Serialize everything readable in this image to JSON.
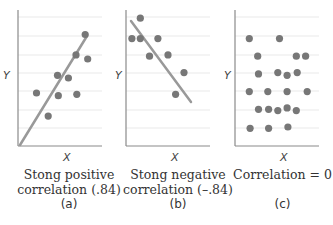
{
  "chart_data": [
    {
      "type": "scatter",
      "panel": "(a)",
      "title": "Stong positive correlation (.84)",
      "xlabel": "X",
      "ylabel": "Y",
      "grid": true,
      "trendline": true,
      "points": [
        {
          "x": 0.8,
          "y": 0.82
        },
        {
          "x": 0.69,
          "y": 0.67
        },
        {
          "x": 0.83,
          "y": 0.64
        },
        {
          "x": 0.47,
          "y": 0.52
        },
        {
          "x": 0.6,
          "y": 0.5
        },
        {
          "x": 0.22,
          "y": 0.39
        },
        {
          "x": 0.48,
          "y": 0.37
        },
        {
          "x": 0.7,
          "y": 0.38
        },
        {
          "x": 0.36,
          "y": 0.22
        }
      ]
    },
    {
      "type": "scatter",
      "panel": "(b)",
      "title": "Stong negative correlation (–.84)",
      "xlabel": "X",
      "ylabel": "Y",
      "grid": true,
      "trendline": true,
      "points": [
        {
          "x": 0.17,
          "y": 0.94
        },
        {
          "x": 0.07,
          "y": 0.79
        },
        {
          "x": 0.17,
          "y": 0.79
        },
        {
          "x": 0.38,
          "y": 0.79
        },
        {
          "x": 0.28,
          "y": 0.66
        },
        {
          "x": 0.5,
          "y": 0.67
        },
        {
          "x": 0.69,
          "y": 0.54
        },
        {
          "x": 0.59,
          "y": 0.38
        }
      ]
    },
    {
      "type": "scatter",
      "panel": "(c)",
      "title": "Correlation = 0",
      "xlabel": "X",
      "ylabel": "Y",
      "grid": true,
      "trendline": false,
      "points": [
        {
          "x": 0.17,
          "y": 0.79
        },
        {
          "x": 0.53,
          "y": 0.79
        },
        {
          "x": 0.27,
          "y": 0.66
        },
        {
          "x": 0.73,
          "y": 0.66
        },
        {
          "x": 0.84,
          "y": 0.66
        },
        {
          "x": 0.28,
          "y": 0.53
        },
        {
          "x": 0.51,
          "y": 0.54
        },
        {
          "x": 0.62,
          "y": 0.52
        },
        {
          "x": 0.74,
          "y": 0.54
        },
        {
          "x": 0.17,
          "y": 0.4
        },
        {
          "x": 0.39,
          "y": 0.4
        },
        {
          "x": 0.62,
          "y": 0.4
        },
        {
          "x": 0.86,
          "y": 0.4
        },
        {
          "x": 0.28,
          "y": 0.27
        },
        {
          "x": 0.4,
          "y": 0.27
        },
        {
          "x": 0.51,
          "y": 0.26
        },
        {
          "x": 0.62,
          "y": 0.28
        },
        {
          "x": 0.73,
          "y": 0.26
        },
        {
          "x": 0.18,
          "y": 0.13
        },
        {
          "x": 0.4,
          "y": 0.13
        },
        {
          "x": 0.63,
          "y": 0.14
        }
      ]
    }
  ],
  "panels": [
    {
      "caption_line1": "Stong positive",
      "caption_line2": "correlation (.84)",
      "label": "(a)",
      "xlabel": "X",
      "ylabel": "Y"
    },
    {
      "caption_line1": "Stong negative",
      "caption_line2": "correlation (–.84)",
      "label": "(b)",
      "xlabel": "X",
      "ylabel": "Y"
    },
    {
      "caption_line1": "Correlation = 0",
      "caption_line2": "",
      "label": "(c)",
      "xlabel": "X",
      "ylabel": "Y"
    }
  ],
  "colors": {
    "point": "#777777",
    "line": "#999999",
    "grid": "#e3e3e3",
    "axis": "#8a8a8a"
  }
}
